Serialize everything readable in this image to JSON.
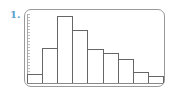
{
  "problem_number": "1.",
  "chart_data": {
    "type": "bar",
    "subtype": "histogram",
    "title": "",
    "xlabel": "",
    "ylabel": "",
    "categories": [
      "1",
      "2",
      "3",
      "4",
      "5",
      "6",
      "7",
      "8",
      "9"
    ],
    "values": [
      9,
      35,
      67,
      53,
      34,
      30,
      24,
      11,
      7
    ],
    "ylim": [
      0,
      69
    ],
    "grid": false,
    "legend": null
  },
  "colors": {
    "number": "#5aa0d0",
    "frame": "#999999",
    "bar_edge": "#666666",
    "bar_fill": "#ffffff"
  }
}
